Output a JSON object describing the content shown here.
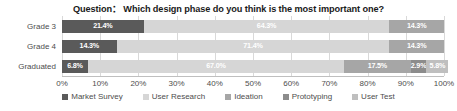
{
  "chart_data": {
    "type": "bar",
    "orientation": "horizontal",
    "stacked": "percent",
    "title": "Question：  Which design phase do you think is the most important one?",
    "xlabel": "",
    "ylabel": "",
    "xlim": [
      0,
      100
    ],
    "grid": true,
    "legend_position": "bottom",
    "categories": [
      "Grade 3",
      "Grade 4",
      "Graduated"
    ],
    "xticks": [
      "0%",
      "10%",
      "20%",
      "30%",
      "40%",
      "50%",
      "60%",
      "70%",
      "80%",
      "90%",
      "100%"
    ],
    "xtick_values": [
      0,
      10,
      20,
      30,
      40,
      50,
      60,
      70,
      80,
      90,
      100
    ],
    "series": [
      {
        "name": "Market Survey",
        "color": "#5a5a5a",
        "label_color": "#ffffff",
        "values": [
          21.4,
          14.3,
          6.8
        ],
        "labels": [
          "21.4%",
          "14.3%",
          "6.8%"
        ]
      },
      {
        "name": "User Research",
        "color": "#d6d6d6",
        "label_color": "#ffffff",
        "values": [
          64.3,
          71.4,
          67.0
        ],
        "labels": [
          "64.3%",
          "71.4%",
          "67.0%"
        ]
      },
      {
        "name": "Ideation",
        "color": "#a6a6a6",
        "label_color": "#ffffff",
        "values": [
          14.3,
          14.3,
          17.5
        ],
        "labels": [
          "14.3%",
          "14.3%",
          "17.5%"
        ]
      },
      {
        "name": "Prototyping",
        "color": "#8c8c8c",
        "label_color": "#ffffff",
        "values": [
          0,
          0,
          2.9
        ],
        "labels": [
          "",
          "",
          "2.9%"
        ]
      },
      {
        "name": "User Test",
        "color": "#bfbfbf",
        "label_color": "#ffffff",
        "values": [
          0,
          0,
          5.8
        ],
        "labels": [
          "",
          "",
          "5.8%"
        ]
      }
    ]
  }
}
